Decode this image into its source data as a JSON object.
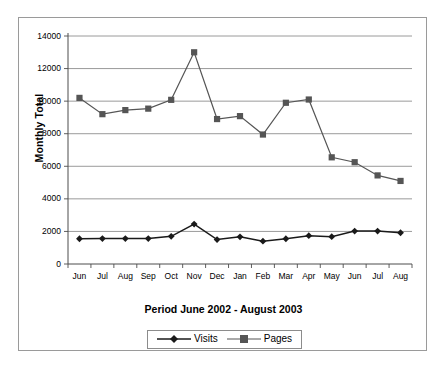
{
  "chart_data": {
    "type": "line",
    "title": "",
    "xlabel": "Period June 2002 - August 2003",
    "ylabel": "Monthly Total",
    "categories": [
      "Jun",
      "Jul",
      "Aug",
      "Sep",
      "Oct",
      "Nov",
      "Dec",
      "Jan",
      "Feb",
      "Mar",
      "Apr",
      "May",
      "Jun",
      "Jul",
      "Aug"
    ],
    "ylim": [
      0,
      14000
    ],
    "yticks": [
      0,
      2000,
      4000,
      6000,
      8000,
      10000,
      12000,
      14000
    ],
    "ytick_labels": [
      "0",
      "2000",
      "4000",
      "6000",
      "8000",
      "10000",
      "12000",
      "14000"
    ],
    "grid": "horizontal",
    "legend_position": "bottom",
    "series": [
      {
        "name": "Visits",
        "marker": "diamond",
        "color": "#1a1a1a",
        "values": [
          1550,
          1560,
          1560,
          1560,
          1700,
          2450,
          1500,
          1670,
          1400,
          1550,
          1740,
          1680,
          2020,
          2020,
          1920
        ]
      },
      {
        "name": "Pages",
        "marker": "square",
        "color": "#555555",
        "values": [
          10200,
          9200,
          9450,
          9540,
          10080,
          13000,
          8900,
          9080,
          7950,
          9900,
          10100,
          6550,
          6250,
          5440,
          5100
        ]
      }
    ]
  },
  "legend": {
    "entries": [
      {
        "label": "Visits",
        "marker": "diamond-marker-icon"
      },
      {
        "label": "Pages",
        "marker": "square-marker-icon"
      }
    ]
  }
}
